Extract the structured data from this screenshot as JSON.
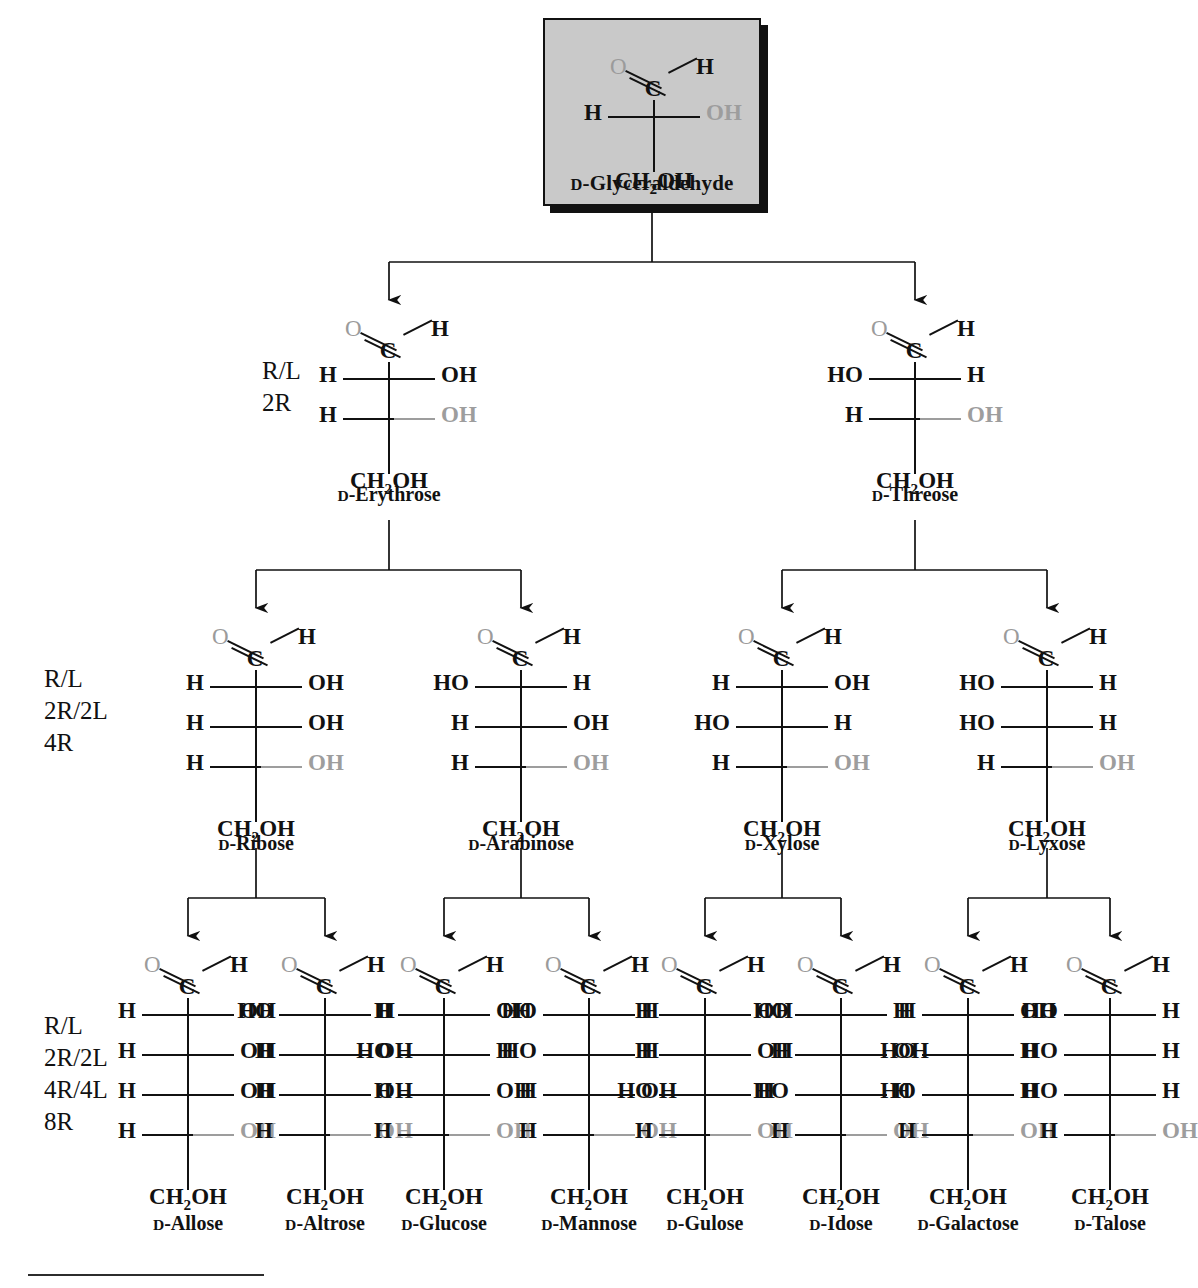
{
  "root": {
    "name_prefix": "D",
    "name": "-Glyceraldehyde",
    "atoms": {
      "o": "O",
      "h": "H",
      "left": "H",
      "right": "OH",
      "foot": "CH",
      "foot_sub": "2",
      "foot_end": "OH"
    }
  },
  "glyph": {
    "o": "O",
    "h": "H",
    "c": "C",
    "H": "H",
    "OH": "OH",
    "HO": "HO",
    "ch2oh_a": "CH",
    "ch2oh_sub": "2",
    "ch2oh_b": "OH"
  },
  "annotations": [
    {
      "id": "tetrose",
      "lines": [
        "R/L",
        "2R"
      ]
    },
    {
      "id": "pentose",
      "lines": [
        "R/L",
        "2R/2L",
        "4R"
      ]
    },
    {
      "id": "hexose",
      "lines": [
        "R/L",
        "2R/2L",
        "4R/4L",
        "8R"
      ]
    }
  ],
  "colors": {
    "highlight_oh": "#9d9d9d",
    "box_fill": "#c9c9c9",
    "ink": "#111111"
  },
  "rows": [
    {
      "id": "tetroses",
      "molecules": [
        {
          "name_prefix": "D",
          "name": "-Erythrose",
          "centers": [
            {
              "left": "H",
              "right": "OH",
              "highlight": false
            },
            {
              "left": "H",
              "right": "OH",
              "highlight": true
            }
          ]
        },
        {
          "name_prefix": "D",
          "name": "-Threose",
          "centers": [
            {
              "left": "HO",
              "right": "H",
              "highlight": false
            },
            {
              "left": "H",
              "right": "OH",
              "highlight": true
            }
          ]
        }
      ]
    },
    {
      "id": "pentoses",
      "molecules": [
        {
          "name_prefix": "D",
          "name": "-Ribose",
          "centers": [
            {
              "left": "H",
              "right": "OH",
              "highlight": false
            },
            {
              "left": "H",
              "right": "OH",
              "highlight": false
            },
            {
              "left": "H",
              "right": "OH",
              "highlight": true
            }
          ]
        },
        {
          "name_prefix": "D",
          "name": "-Arabinose",
          "centers": [
            {
              "left": "HO",
              "right": "H",
              "highlight": false
            },
            {
              "left": "H",
              "right": "OH",
              "highlight": false
            },
            {
              "left": "H",
              "right": "OH",
              "highlight": true
            }
          ]
        },
        {
          "name_prefix": "D",
          "name": "-Xylose",
          "centers": [
            {
              "left": "H",
              "right": "OH",
              "highlight": false
            },
            {
              "left": "HO",
              "right": "H",
              "highlight": false
            },
            {
              "left": "H",
              "right": "OH",
              "highlight": true
            }
          ]
        },
        {
          "name_prefix": "D",
          "name": "-Lyxose",
          "centers": [
            {
              "left": "HO",
              "right": "H",
              "highlight": false
            },
            {
              "left": "HO",
              "right": "H",
              "highlight": false
            },
            {
              "left": "H",
              "right": "OH",
              "highlight": true
            }
          ]
        }
      ]
    },
    {
      "id": "hexoses",
      "molecules": [
        {
          "name_prefix": "D",
          "name": "-Allose",
          "centers": [
            {
              "left": "H",
              "right": "OH",
              "highlight": false
            },
            {
              "left": "H",
              "right": "OH",
              "highlight": false
            },
            {
              "left": "H",
              "right": "OH",
              "highlight": false
            },
            {
              "left": "H",
              "right": "OH",
              "highlight": true
            }
          ]
        },
        {
          "name_prefix": "D",
          "name": "-Altrose",
          "centers": [
            {
              "left": "HO",
              "right": "H",
              "highlight": false
            },
            {
              "left": "H",
              "right": "OH",
              "highlight": false
            },
            {
              "left": "H",
              "right": "OH",
              "highlight": false
            },
            {
              "left": "H",
              "right": "OH",
              "highlight": true
            }
          ]
        },
        {
          "name_prefix": "D",
          "name": "-Glucose",
          "centers": [
            {
              "left": "H",
              "right": "OH",
              "highlight": false
            },
            {
              "left": "HO",
              "right": "H",
              "highlight": false
            },
            {
              "left": "H",
              "right": "OH",
              "highlight": false
            },
            {
              "left": "H",
              "right": "OH",
              "highlight": true
            }
          ]
        },
        {
          "name_prefix": "D",
          "name": "-Mannose",
          "centers": [
            {
              "left": "HO",
              "right": "H",
              "highlight": false
            },
            {
              "left": "HO",
              "right": "H",
              "highlight": false
            },
            {
              "left": "H",
              "right": "OH",
              "highlight": false
            },
            {
              "left": "H",
              "right": "OH",
              "highlight": true
            }
          ]
        },
        {
          "name_prefix": "D",
          "name": "-Gulose",
          "centers": [
            {
              "left": "H",
              "right": "OH",
              "highlight": false
            },
            {
              "left": "H",
              "right": "OH",
              "highlight": false
            },
            {
              "left": "HO",
              "right": "H",
              "highlight": false
            },
            {
              "left": "H",
              "right": "OH",
              "highlight": true
            }
          ]
        },
        {
          "name_prefix": "D",
          "name": "-Idose",
          "centers": [
            {
              "left": "HO",
              "right": "H",
              "highlight": false
            },
            {
              "left": "H",
              "right": "OH",
              "highlight": false
            },
            {
              "left": "HO",
              "right": "H",
              "highlight": false
            },
            {
              "left": "H",
              "right": "OH",
              "highlight": true
            }
          ]
        },
        {
          "name_prefix": "D",
          "name": "-Galactose",
          "centers": [
            {
              "left": "H",
              "right": "OH",
              "highlight": false
            },
            {
              "left": "HO",
              "right": "H",
              "highlight": false
            },
            {
              "left": "HO",
              "right": "H",
              "highlight": false
            },
            {
              "left": "H",
              "right": "OH",
              "highlight": true
            }
          ]
        },
        {
          "name_prefix": "D",
          "name": "-Talose",
          "centers": [
            {
              "left": "HO",
              "right": "H",
              "highlight": false
            },
            {
              "left": "HO",
              "right": "H",
              "highlight": false
            },
            {
              "left": "HO",
              "right": "H",
              "highlight": false
            },
            {
              "left": "H",
              "right": "OH",
              "highlight": true
            }
          ]
        }
      ]
    }
  ]
}
